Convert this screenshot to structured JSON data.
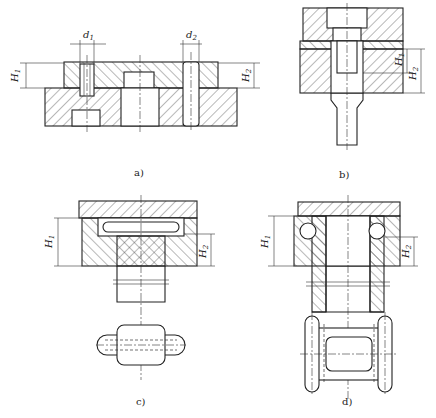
{
  "figure": {
    "panels": [
      {
        "id": "a",
        "caption": "a)",
        "dims": {
          "d1": "d",
          "d1_sub": "1",
          "d2": "d",
          "d2_sub": "2",
          "H1": "H",
          "H1_sub": "1",
          "H2": "H",
          "H2_sub": "2"
        }
      },
      {
        "id": "b",
        "caption": "b)",
        "dims": {
          "H1": "H",
          "H1_sub": "1",
          "H2": "H",
          "H2_sub": "2"
        }
      },
      {
        "id": "c",
        "caption": "c)",
        "dims": {
          "H1": "H",
          "H1_sub": "1",
          "H2": "H",
          "H2_sub": "2"
        }
      },
      {
        "id": "d",
        "caption": "d)",
        "dims": {
          "H1": "H",
          "H1_sub": "1",
          "H2": "H",
          "H2_sub": "2"
        }
      }
    ]
  }
}
